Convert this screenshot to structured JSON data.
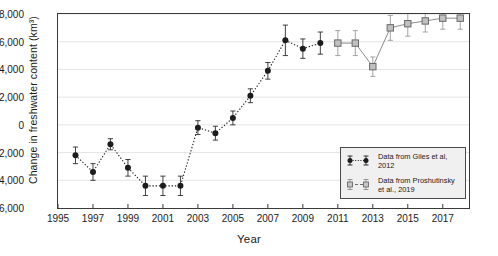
{
  "chart_data": {
    "type": "scatter",
    "title": "",
    "xlabel": "Year",
    "ylabel": "Change in freshwater content (km³)",
    "xlim": [
      1995,
      2018.5
    ],
    "ylim": [
      -6000,
      8000
    ],
    "xticks": [
      1995,
      1997,
      1999,
      2001,
      2003,
      2005,
      2007,
      2009,
      2011,
      2013,
      2015,
      2017
    ],
    "xticklabels": [
      "1995",
      "1997",
      "1999",
      "2001",
      "2003",
      "2005",
      "2007",
      "2009",
      "2011",
      "2013",
      "2015",
      "2017"
    ],
    "yticks": [
      -6000,
      -4000,
      -2000,
      0,
      2000,
      4000,
      6000,
      8000
    ],
    "yticklabels": [
      "-6,000",
      "-4,000",
      "-2,000",
      "0",
      "2,000",
      "4,000",
      "6,000",
      "8,000"
    ],
    "grid": true,
    "grid_axis": "y",
    "legend_position": "lower right",
    "series": [
      {
        "name": "Data from Giles et al, 2012",
        "marker": "filled-circle",
        "color": "#1c1c1c",
        "linestyle": "dotted",
        "x": [
          1996,
          1997,
          1998,
          1999,
          2000,
          2001,
          2002,
          2003,
          2004,
          2005,
          2006,
          2007,
          2008,
          2009,
          2010
        ],
        "y": [
          -2200,
          -3400,
          -1400,
          -3100,
          -4400,
          -4400,
          -4400,
          -200,
          -600,
          500,
          2100,
          3900,
          6100,
          5500,
          5900
        ],
        "yerr": [
          600,
          600,
          400,
          600,
          700,
          700,
          700,
          500,
          500,
          500,
          500,
          600,
          1100,
          700,
          800
        ]
      },
      {
        "name": "Data from Proshutinsky et al., 2019",
        "marker": "open-square",
        "color": "#8c8c8c",
        "linestyle": "solid",
        "x": [
          2011,
          2012,
          2013,
          2014,
          2015,
          2016,
          2017,
          2018
        ],
        "y": [
          5900,
          5900,
          4200,
          7000,
          7300,
          7500,
          7700,
          7700
        ],
        "yerr": [
          900,
          900,
          700,
          900,
          900,
          800,
          800,
          800
        ]
      }
    ]
  },
  "legend": {
    "entries": [
      {
        "label": "Data from Giles et al, 2012"
      },
      {
        "label": "Data from Proshutinsky\net al., 2019"
      }
    ]
  }
}
